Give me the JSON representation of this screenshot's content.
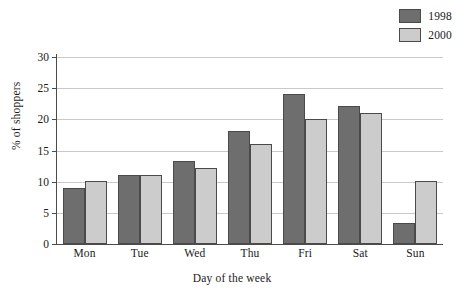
{
  "chart_data": {
    "type": "bar",
    "title": "",
    "xlabel": "Day of the week",
    "ylabel": "% of shoppers",
    "categories": [
      "Mon",
      "Tue",
      "Wed",
      "Thu",
      "Fri",
      "Sat",
      "Sun"
    ],
    "series": [
      {
        "name": "1998",
        "color": "#6e6e6e",
        "values": [
          9,
          11,
          13.3,
          18.1,
          24.1,
          22.1,
          3.4
        ]
      },
      {
        "name": "2000",
        "color": "#cccccc",
        "values": [
          10.1,
          11,
          12.2,
          16.1,
          20,
          21,
          10.1
        ]
      }
    ],
    "ylim": [
      0,
      30
    ],
    "yticks": [
      0,
      5,
      10,
      15,
      20,
      25,
      30
    ],
    "ytick_labels": [
      "0",
      "5",
      "10",
      "15",
      "20",
      "25",
      "30"
    ],
    "grid": true,
    "legend_position": "top-right"
  },
  "legend": {
    "entries": [
      {
        "label": "1998"
      },
      {
        "label": "2000"
      }
    ]
  },
  "colors": {
    "series_1998": "#6e6e6e",
    "series_2000": "#cccccc",
    "gridline": "#c9c9c9",
    "axis": "#4b4b4b",
    "bar_outline": "#4a4a4a",
    "background": "#ffffff",
    "text": "#1a1a1a"
  }
}
